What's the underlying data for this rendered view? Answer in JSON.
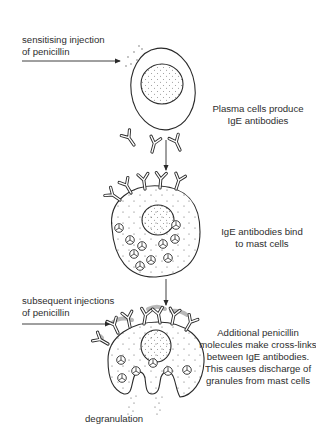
{
  "diagram": {
    "stages": [
      {
        "id": "plasma",
        "input_label": [
          "sensitising injection",
          "of penicillin"
        ],
        "caption": [
          "Plasma cells produce",
          "IgE antibodies"
        ]
      },
      {
        "id": "binding",
        "caption": [
          "IgE antibodies bind",
          "to mast cells"
        ]
      },
      {
        "id": "crosslink",
        "input_label": [
          "subsequent injections",
          "of penicillin"
        ],
        "caption": [
          "Additional penicillin",
          "molecules make cross-links",
          "between IgE antibodies.",
          "This causes discharge of",
          "granules from mast cells"
        ],
        "bottom_label": "degranulation"
      }
    ],
    "colors": {
      "line": "#2a2a2a",
      "penicillin_shading": "#b8b8b8",
      "background": "#ffffff"
    }
  }
}
